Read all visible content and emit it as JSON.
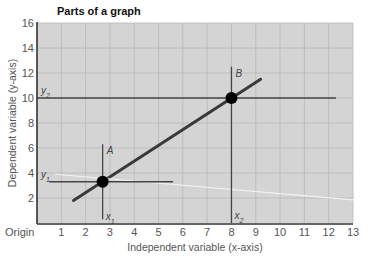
{
  "chart_data": {
    "type": "line",
    "title": "Parts of a graph",
    "xlabel": "Independent variable (x-axis)",
    "ylabel": "Dependent variable (y-axis)",
    "origin_label": "Origin",
    "xlim": [
      0,
      13
    ],
    "ylim": [
      0,
      16
    ],
    "x_ticks": [
      1,
      2,
      3,
      4,
      5,
      6,
      7,
      8,
      9,
      10,
      11,
      12,
      13
    ],
    "y_ticks": [
      2,
      4,
      6,
      8,
      10,
      12,
      14,
      16
    ],
    "grid": true,
    "colors": {
      "plot_background": "#d4d4d4",
      "grid": "#b8b8b8",
      "axis": "#333333",
      "main_line": "#3a3a3a",
      "light_line": "#f2f2f2",
      "guide_line": "#444444",
      "point": "#000000"
    },
    "series": [
      {
        "name": "main-line",
        "points": [
          [
            1.5,
            1.8
          ],
          [
            9.2,
            11.5
          ]
        ]
      },
      {
        "name": "light-line",
        "points": [
          [
            0.75,
            3.9
          ],
          [
            13,
            1.85
          ]
        ]
      }
    ],
    "points": [
      {
        "label": "A",
        "x": 2.7,
        "y": 3.3,
        "x_label": "x1",
        "y_label": "y1"
      },
      {
        "label": "B",
        "x": 8.0,
        "y": 10.0,
        "x_label": "x2",
        "y_label": "y2"
      }
    ],
    "guide_lines": [
      {
        "name": "y1-horizontal",
        "from": [
          0.5,
          3.3
        ],
        "to": [
          5.6,
          3.3
        ]
      },
      {
        "name": "x1-vertical",
        "from": [
          2.7,
          6.3
        ],
        "to": [
          2.7,
          0.3
        ]
      },
      {
        "name": "y2-horizontal",
        "from": [
          0,
          10
        ],
        "to": [
          12.3,
          10
        ]
      },
      {
        "name": "x2-vertical",
        "from": [
          8.0,
          12.5
        ],
        "to": [
          8.0,
          0
        ]
      }
    ]
  }
}
